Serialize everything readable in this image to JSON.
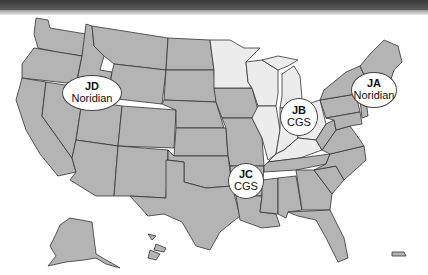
{
  "map": {
    "title": "",
    "colors": {
      "regular_states": "#b4b4b4",
      "jb_states": "#ececec",
      "outline": "#333333",
      "label_bg": "#ffffff",
      "top_bar": "#444444"
    },
    "jurisdictions": [
      {
        "code": "JA",
        "contractor": "Noridian",
        "region": "Northeast"
      },
      {
        "code": "JB",
        "contractor": "CGS",
        "region": "Midwest"
      },
      {
        "code": "JC",
        "contractor": "CGS",
        "region": "South"
      },
      {
        "code": "JD",
        "contractor": "Noridian",
        "region": "West"
      }
    ],
    "insets": [
      "Alaska",
      "Hawaii",
      "Puerto Rico"
    ]
  }
}
